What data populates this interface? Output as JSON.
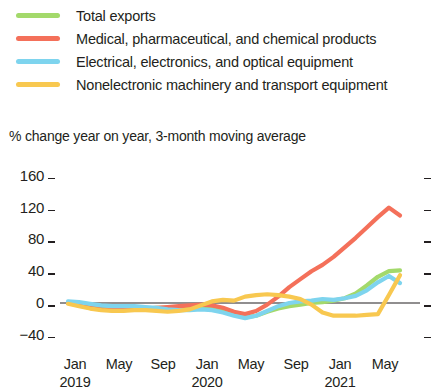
{
  "legend": {
    "items": [
      {
        "label": "Total exports",
        "color": "#a3d96b",
        "name": "total-exports"
      },
      {
        "label": "Medical, pharmaceutical, and chemical products",
        "color": "#f4705a",
        "name": "medical-pharma-chemical"
      },
      {
        "label": "Electrical, electronics, and optical equipment",
        "color": "#7ed4ee",
        "name": "electrical-electronics-optical"
      },
      {
        "label": "Nonelectronic machinery and transport equipment",
        "color": "#f8c850",
        "name": "nonelectronic-machinery-transport"
      }
    ]
  },
  "subtitle": "% change year on year, 3-month moving average",
  "chart_data": {
    "type": "line",
    "title": "",
    "subtitle": "% change year on year, 3-month moving average",
    "xlabel": "",
    "ylabel": "% change year on year, 3-month moving average",
    "ylim": [
      -40,
      160
    ],
    "yticks": [
      -40,
      0,
      40,
      80,
      120,
      160
    ],
    "ytick_labels": [
      "−40",
      "0",
      "40",
      "80",
      "120",
      "160"
    ],
    "grid": false,
    "legend_position": "top",
    "zero_line": true,
    "x": [
      "2019-01",
      "2019-02",
      "2019-03",
      "2019-04",
      "2019-05",
      "2019-06",
      "2019-07",
      "2019-08",
      "2019-09",
      "2019-10",
      "2019-11",
      "2019-12",
      "2020-01",
      "2020-02",
      "2020-03",
      "2020-04",
      "2020-05",
      "2020-06",
      "2020-07",
      "2020-08",
      "2020-09",
      "2020-10",
      "2020-11",
      "2020-12",
      "2021-01",
      "2021-02",
      "2021-03",
      "2021-04",
      "2021-05",
      "2021-06",
      "2021-07"
    ],
    "xtick_labels": [
      "Jan",
      "May",
      "Sep",
      "Jan",
      "May",
      "Sep",
      "Jan",
      "May"
    ],
    "xtick_years": [
      "2019",
      "",
      "",
      "2020",
      "",
      "",
      "2021",
      ""
    ],
    "series": [
      {
        "name": "Total exports",
        "color": "#a3d96b",
        "values": [
          0,
          -2,
          -4,
          -6,
          -7,
          -8,
          -8,
          -7,
          -6,
          -6,
          -6,
          -5,
          -4,
          -5,
          -8,
          -14,
          -18,
          -16,
          -11,
          -7,
          -4,
          -2,
          0,
          1,
          3,
          6,
          12,
          22,
          33,
          40,
          41
        ]
      },
      {
        "name": "Medical, pharmaceutical, and chemical products",
        "color": "#f4705a",
        "values": [
          0,
          -3,
          -6,
          -8,
          -9,
          -9,
          -8,
          -7,
          -6,
          -5,
          -4,
          -3,
          -2,
          -3,
          -6,
          -11,
          -14,
          -10,
          -2,
          8,
          20,
          30,
          40,
          48,
          58,
          70,
          82,
          95,
          108,
          120,
          110
        ]
      },
      {
        "name": "Electrical, electronics, and optical equipment",
        "color": "#7ed4ee",
        "values": [
          2,
          1,
          -1,
          -3,
          -4,
          -4,
          -4,
          -5,
          -6,
          -8,
          -9,
          -9,
          -8,
          -9,
          -12,
          -16,
          -19,
          -16,
          -10,
          -4,
          0,
          2,
          3,
          5,
          4,
          6,
          9,
          16,
          26,
          34,
          25
        ]
      },
      {
        "name": "Nonelectronic machinery and transport equipment",
        "color": "#f8c850",
        "values": [
          -1,
          -4,
          -7,
          -9,
          -10,
          -10,
          -9,
          -9,
          -10,
          -11,
          -10,
          -8,
          -3,
          2,
          4,
          3,
          8,
          10,
          11,
          10,
          8,
          5,
          -2,
          -12,
          -16,
          -16,
          -16,
          -15,
          -14,
          10,
          35
        ]
      }
    ]
  }
}
